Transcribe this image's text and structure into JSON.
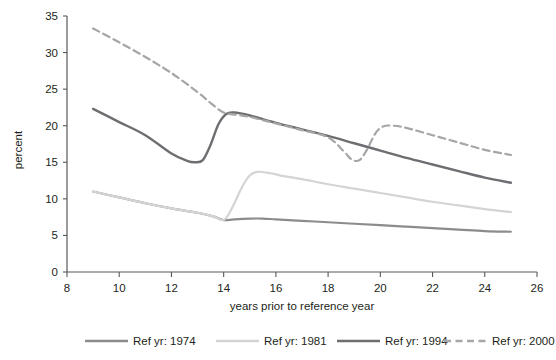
{
  "chart_data": {
    "type": "line",
    "title": "",
    "xlabel": "years prior to reference year",
    "ylabel": "percent",
    "xlim": [
      8,
      26
    ],
    "ylim": [
      0,
      35
    ],
    "xticks": [
      8,
      10,
      12,
      14,
      16,
      18,
      20,
      22,
      24,
      26
    ],
    "yticks": [
      0,
      5,
      10,
      15,
      20,
      25,
      30,
      35
    ],
    "grid": false,
    "legend_position": "bottom",
    "series": [
      {
        "name": "Ref yr: 1974",
        "label": "Ref yr: 1974",
        "color": "#8c8c8c",
        "dashed": false,
        "linewidth": 2.2,
        "x": [
          9,
          10,
          11,
          12,
          13,
          13.6,
          14,
          14.4,
          15,
          15.5,
          16,
          17,
          18,
          19,
          20,
          21,
          22,
          23,
          24,
          25
        ],
        "y": [
          11.0,
          10.2,
          9.4,
          8.7,
          8.1,
          7.6,
          7.1,
          7.2,
          7.3,
          7.3,
          7.2,
          7.0,
          6.8,
          6.6,
          6.4,
          6.2,
          6.0,
          5.8,
          5.6,
          5.5
        ]
      },
      {
        "name": "Ref yr: 1981",
        "label": "Ref yr: 1981",
        "color": "#d4d4d4",
        "dashed": false,
        "linewidth": 2.2,
        "x": [
          9,
          10,
          11,
          12,
          13,
          13.6,
          14,
          14.3,
          14.7,
          15.0,
          15.3,
          15.8,
          16.3,
          17,
          18,
          19,
          20,
          21,
          22,
          23,
          24,
          25
        ],
        "y": [
          11.0,
          10.2,
          9.4,
          8.7,
          8.1,
          7.6,
          7.1,
          8.6,
          11.6,
          13.2,
          13.7,
          13.5,
          13.1,
          12.7,
          12.0,
          11.4,
          10.8,
          10.2,
          9.6,
          9.1,
          8.6,
          8.2
        ]
      },
      {
        "name": "Ref yr: 1994",
        "label": "Ref yr: 1994",
        "color": "#6d6e71",
        "dashed": false,
        "linewidth": 2.4,
        "x": [
          9,
          10,
          11,
          12,
          12.6,
          12.9,
          13.2,
          13.5,
          13.8,
          14.1,
          14.4,
          15,
          16,
          17,
          18,
          19,
          20,
          21,
          22,
          23,
          24,
          25
        ],
        "y": [
          22.3,
          20.5,
          18.7,
          16.2,
          15.2,
          15.0,
          15.3,
          17.4,
          20.2,
          21.6,
          21.8,
          21.4,
          20.4,
          19.5,
          18.6,
          17.6,
          16.6,
          15.6,
          14.7,
          13.8,
          12.9,
          12.2
        ]
      },
      {
        "name": "Ref yr: 2000",
        "label": "Ref yr: 2000",
        "color": "#a6a6a6",
        "dashed": true,
        "linewidth": 2.2,
        "x": [
          9,
          10,
          11,
          12,
          13,
          13.5,
          14,
          14.5,
          15,
          16,
          17,
          18,
          18.6,
          18.9,
          19.2,
          19.5,
          19.8,
          20.1,
          20.5,
          21,
          22,
          23,
          24,
          25
        ],
        "y": [
          33.3,
          31.4,
          29.4,
          27.2,
          24.6,
          23.1,
          21.8,
          21.5,
          21.2,
          20.3,
          19.4,
          18.4,
          16.5,
          15.4,
          15.3,
          16.8,
          18.9,
          19.9,
          20.0,
          19.7,
          18.7,
          17.7,
          16.7,
          16.0
        ]
      }
    ]
  },
  "legend": {
    "items": [
      {
        "label": "Ref yr: 1974",
        "color": "#8c8c8c",
        "dashed": false
      },
      {
        "label": "Ref yr: 1981",
        "color": "#d4d4d4",
        "dashed": false
      },
      {
        "label": "Ref yr: 1994",
        "color": "#6d6e71",
        "dashed": false
      },
      {
        "label": "Ref yr: 2000",
        "color": "#a6a6a6",
        "dashed": true
      }
    ]
  }
}
